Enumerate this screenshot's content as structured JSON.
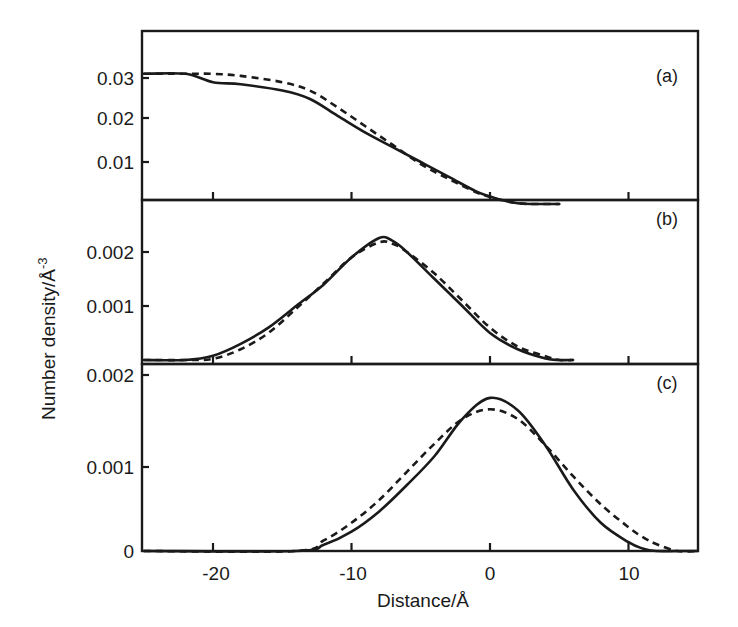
{
  "chart_data": [
    {
      "type": "line",
      "panel": "(a)",
      "title": "",
      "xlabel": "Distance/Å",
      "ylabel": "Number density/Å-3",
      "xlim": [
        -25,
        15
      ],
      "ylim": [
        0,
        0.04
      ],
      "yticks": [
        "0.01",
        "0.02",
        "0.03"
      ],
      "x": [
        -25,
        -22,
        -20,
        -18,
        -15,
        -13,
        -11,
        -9,
        -7,
        -5,
        -3,
        -1,
        0,
        1,
        2,
        3,
        5
      ],
      "series": [
        {
          "name": "solid",
          "style": "solid",
          "values": [
            0.031,
            0.031,
            0.029,
            0.0285,
            0.027,
            0.025,
            0.021,
            0.017,
            0.0135,
            0.01,
            0.0065,
            0.003,
            0.0018,
            0.0008,
            0.0002,
            0.0,
            0.0
          ]
        },
        {
          "name": "dashed",
          "style": "dashed",
          "values": [
            0.031,
            0.031,
            0.031,
            0.0305,
            0.029,
            0.027,
            0.023,
            0.0185,
            0.014,
            0.0095,
            0.006,
            0.0028,
            0.0017,
            0.0008,
            0.0002,
            0.0,
            0.0
          ]
        }
      ]
    },
    {
      "type": "line",
      "panel": "(b)",
      "xlim": [
        -25,
        15
      ],
      "ylim": [
        0,
        0.0029
      ],
      "yticks": [
        "0.001",
        "0.002"
      ],
      "x": [
        -25,
        -22,
        -20,
        -18,
        -16,
        -14,
        -12,
        -10,
        -8,
        -7,
        -6,
        -4,
        -2,
        0,
        2,
        4,
        5,
        6
      ],
      "series": [
        {
          "name": "solid",
          "style": "solid",
          "values": [
            0.0,
            0.0,
            8e-05,
            0.0003,
            0.0006,
            0.001,
            0.0014,
            0.0019,
            0.00226,
            0.0022,
            0.002,
            0.0015,
            0.001,
            0.0005,
            0.0002,
            3e-05,
            0.0,
            0.0
          ]
        },
        {
          "name": "dashed",
          "style": "dashed",
          "values": [
            0.0,
            0.0,
            2e-05,
            0.0002,
            0.0005,
            0.00095,
            0.00142,
            0.0019,
            0.00218,
            0.00215,
            0.002,
            0.0016,
            0.0011,
            0.0006,
            0.00025,
            7e-05,
            0.0,
            0.0
          ]
        }
      ]
    },
    {
      "type": "line",
      "panel": "(c)",
      "xlim": [
        -25,
        15
      ],
      "ylim": [
        0,
        0.0021
      ],
      "yticks": [
        "0",
        "0.001",
        "0.002"
      ],
      "xticks": [
        "-20",
        "-10",
        "0",
        "10"
      ],
      "x": [
        -25,
        -14,
        -12,
        -10,
        -8,
        -6,
        -4,
        -2,
        0,
        2,
        4,
        6,
        8,
        10,
        11,
        12,
        13.5,
        15
      ],
      "series": [
        {
          "name": "solid",
          "style": "solid",
          "values": [
            0.0,
            0.0,
            7e-05,
            0.00022,
            0.00045,
            0.00075,
            0.00108,
            0.0015,
            0.00174,
            0.0016,
            0.0012,
            0.0007,
            0.00032,
            0.0001,
            3e-05,
            0.0,
            0.0,
            0.0
          ]
        },
        {
          "name": "dashed",
          "style": "dashed",
          "values": [
            0.0,
            0.0,
            0.00012,
            0.00032,
            0.00058,
            0.0009,
            0.00122,
            0.0015,
            0.00161,
            0.0015,
            0.0012,
            0.00085,
            0.00053,
            0.00027,
            0.00016,
            8e-05,
            0.0,
            0.0
          ]
        }
      ]
    }
  ],
  "labels": {
    "panel_a": "(a)",
    "panel_b": "(b)",
    "panel_c": "(c)",
    "xlabel": "Distance/Å",
    "ylabel": "Number density/Å",
    "ylabel_sup": "-3",
    "a_ticks": [
      "0.03",
      "0.02",
      "0.01"
    ],
    "b_ticks": [
      "0.002",
      "0.001"
    ],
    "c_ticks": [
      "0.002",
      "0.001",
      "0"
    ],
    "x_ticks": [
      "-20",
      "-10",
      "0",
      "10"
    ]
  }
}
